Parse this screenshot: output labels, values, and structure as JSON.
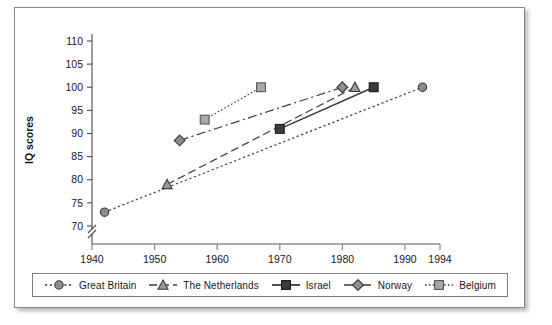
{
  "chart_data": {
    "type": "line",
    "title": "",
    "xlabel": "",
    "ylabel": "IQ scores",
    "xlim": [
      1940,
      1994
    ],
    "ylim": [
      70,
      110
    ],
    "yticks": [
      70,
      75,
      80,
      85,
      90,
      95,
      100,
      105,
      110
    ],
    "xticks": [
      1940,
      1950,
      1960,
      1970,
      1980,
      1990,
      1994
    ],
    "y_axis_break": true,
    "grid": false,
    "legend_position": "bottom",
    "series": [
      {
        "name": "Great Britain",
        "marker": "circle",
        "line_style": "dotted",
        "color": "#8c8c8c",
        "x": [
          1942,
          1992
        ],
        "y": [
          73,
          100
        ]
      },
      {
        "name": "The Netherlands",
        "marker": "triangle",
        "line_style": "dashed",
        "color": "#9a9a9a",
        "x": [
          1952,
          1982
        ],
        "y": [
          79,
          100
        ]
      },
      {
        "name": "Israel",
        "marker": "square-filled",
        "line_style": "solid",
        "color": "#3d3d3d",
        "x": [
          1970,
          1985
        ],
        "y": [
          91,
          100
        ]
      },
      {
        "name": "Norway",
        "marker": "diamond",
        "line_style": "dash-dot",
        "color": "#8f8f8f",
        "x": [
          1954,
          1980
        ],
        "y": [
          88.5,
          100
        ]
      },
      {
        "name": "Belgium",
        "marker": "square-light",
        "line_style": "fine-dotted",
        "color": "#a8a8a8",
        "x": [
          1958,
          1967
        ],
        "y": [
          93,
          100
        ]
      }
    ]
  },
  "axis": {
    "ylabel": "IQ scores",
    "ytick_labels": [
      "110",
      "105",
      "100",
      "95",
      "90",
      "85",
      "80",
      "75",
      "70"
    ],
    "xtick_labels": [
      "1940",
      "1950",
      "1960",
      "1970",
      "1980",
      "1990",
      "1994"
    ]
  },
  "legend": {
    "items": [
      {
        "label": "Great Britain"
      },
      {
        "label": "The Netherlands"
      },
      {
        "label": "Israel"
      },
      {
        "label": "Norway"
      },
      {
        "label": "Belgium"
      }
    ]
  }
}
